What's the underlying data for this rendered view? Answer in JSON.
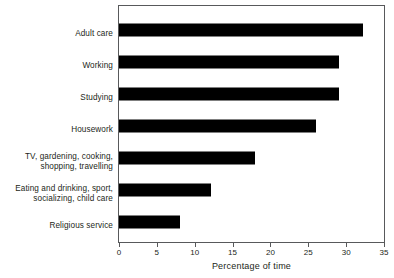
{
  "chart_data": {
    "type": "bar",
    "orientation": "horizontal",
    "title": "",
    "xlabel": "Percentage of time",
    "ylabel": "",
    "xlim": [
      0,
      35
    ],
    "xticks": [
      0,
      5,
      10,
      15,
      20,
      25,
      30,
      35
    ],
    "grid": false,
    "legend": null,
    "bar_color": "#000000",
    "frame_color": "#58595b",
    "text_color": "#231f20",
    "categories": [
      "Adult care",
      "Working",
      "Studying",
      "Housework",
      "TV, gardening, cooking,\nshopping, travelling",
      "Eating and drinking, sport,\nsocializing, child care",
      "Religious service"
    ],
    "values": [
      32.2,
      29.0,
      29.0,
      26.0,
      18.0,
      12.2,
      8.0
    ]
  }
}
